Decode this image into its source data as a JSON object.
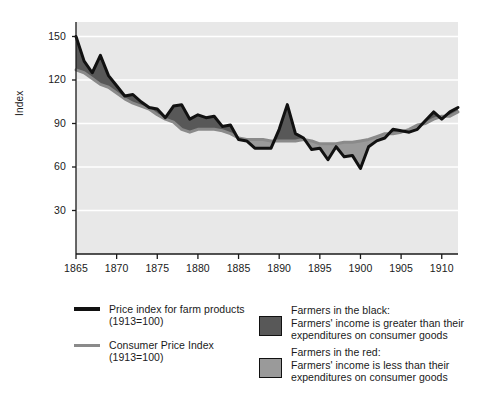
{
  "figure": {
    "background": "#ffffff",
    "plot_background": "#e8e8e8",
    "gridline_color": "#ffffff",
    "axis_color": "#1a1a1a",
    "plot_rect": {
      "x": 76,
      "y": 22,
      "width": 382,
      "height": 232
    }
  },
  "axes": {
    "y_label": "Index",
    "y_ticks": [
      "150",
      "120",
      "90",
      "60",
      "30"
    ],
    "y_tick_values": [
      150,
      120,
      90,
      60,
      30
    ],
    "x_ticks": [
      "1865",
      "1870",
      "1875",
      "1880",
      "1885",
      "1890",
      "1895",
      "1900",
      "1905",
      "1910"
    ],
    "x_tick_values": [
      1865,
      1870,
      1875,
      1880,
      1885,
      1890,
      1895,
      1900,
      1905,
      1910
    ]
  },
  "legend": {
    "line_entries": [
      {
        "name": "farm-price-index",
        "color": "#111111",
        "thickness": 4,
        "line1": "Price index for farm products",
        "line2": "(1913=100)"
      },
      {
        "name": "consumer-price-index",
        "color": "#8a8a8a",
        "thickness": 3,
        "line1": "Consumer Price Index",
        "line2": "(1913=100)"
      }
    ],
    "box_entries": [
      {
        "name": "farmers-in-the-black",
        "color": "#585858",
        "title": "Farmers in the black:",
        "line1": "Farmers' income is greater than their",
        "line2": "expenditures on consumer goods"
      },
      {
        "name": "farmers-in-the-red",
        "color": "#9a9a9a",
        "title": "Farmers in the red:",
        "line1": "Farmers' income is less than their",
        "line2": "expenditures on consumer goods"
      }
    ]
  },
  "chart_data": {
    "type": "area",
    "title": "",
    "xlabel": "",
    "ylabel": "Index",
    "xlim": [
      1865,
      1912
    ],
    "ylim": [
      0,
      160
    ],
    "grid": true,
    "grid_axis": "y",
    "grid_values": [
      150,
      120,
      90,
      60,
      30
    ],
    "legend_position": "below-plot",
    "fill_between": {
      "above_color": "#585858",
      "above_label": "Farmers in the black: Farmers' income is greater than their expenditures on consumer goods",
      "below_color": "#9a9a9a",
      "below_label": "Farmers in the red: Farmers' income is less than their expenditures on consumer goods"
    },
    "x": [
      1865,
      1866,
      1867,
      1868,
      1869,
      1870,
      1871,
      1872,
      1873,
      1874,
      1875,
      1876,
      1877,
      1878,
      1879,
      1880,
      1881,
      1882,
      1883,
      1884,
      1885,
      1886,
      1887,
      1888,
      1889,
      1890,
      1891,
      1892,
      1893,
      1894,
      1895,
      1896,
      1897,
      1898,
      1899,
      1900,
      1901,
      1902,
      1903,
      1904,
      1905,
      1906,
      1907,
      1908,
      1909,
      1910,
      1911,
      1912
    ],
    "series": [
      {
        "name": "Price index for farm products (1913=100)",
        "color": "#111111",
        "width": 3,
        "values": [
          150,
          133,
          125,
          137,
          123,
          116,
          109,
          110,
          105,
          101,
          100,
          94,
          102,
          103,
          93,
          96,
          94,
          95,
          88,
          89,
          79,
          78,
          73,
          73,
          73,
          86,
          103,
          83,
          80,
          72,
          73,
          65,
          74,
          67,
          68,
          59,
          74,
          78,
          80,
          86,
          85,
          84,
          86,
          92,
          98,
          93,
          98,
          101
        ]
      },
      {
        "name": "Consumer Price Index (1913=100)",
        "color": "#8a8a8a",
        "width": 3,
        "values": [
          127,
          125,
          121,
          117,
          115,
          111,
          107,
          104,
          102,
          100,
          96,
          93,
          91,
          86,
          84,
          86,
          86,
          86,
          85,
          83,
          80,
          79,
          79,
          79,
          78,
          78,
          78,
          78,
          79,
          78,
          76,
          76,
          76,
          77,
          77,
          78,
          79,
          81,
          83,
          83,
          84,
          86,
          89,
          90,
          93,
          95,
          95,
          98
        ]
      }
    ]
  }
}
